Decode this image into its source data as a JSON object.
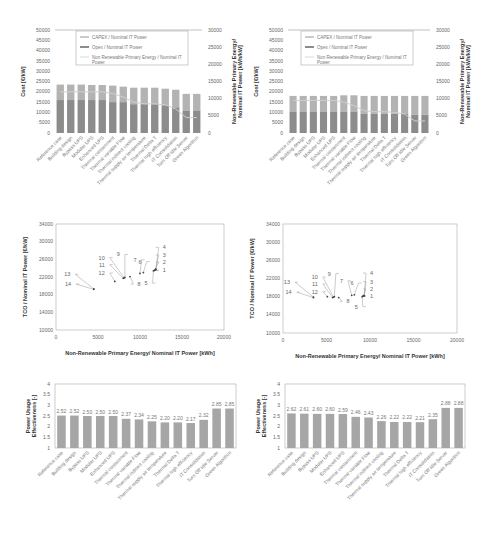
{
  "chart_data": [
    {
      "id": "cost_left",
      "type": "bar",
      "stacked": true,
      "categories": [
        "Reference case",
        "Building design",
        "Bypass UPS",
        "Modular UPS",
        "Enhanced UPS",
        "Thermal containment",
        "Thermal variable Flow",
        "Thermal indirect cooling",
        "Thermal supply air temperature",
        "Thermal Delta T",
        "Thermal high efficiency",
        "IT Consolidation",
        "Turn Off Idle Server",
        "Green Algorithm"
      ],
      "series": [
        {
          "name": "Opex / Nominal IT Power",
          "values": [
            16000,
            16000,
            16000,
            16000,
            16000,
            15000,
            15000,
            14000,
            14000,
            14000,
            13500,
            12500,
            11000,
            11000
          ],
          "color": "#8c8c8c"
        },
        {
          "name": "CAPEX / Nominal IT Power",
          "values": [
            7500,
            7500,
            7500,
            7300,
            7300,
            8000,
            7500,
            8000,
            8000,
            8000,
            8000,
            8500,
            8000,
            8000
          ],
          "color": "#b3b3b3"
        }
      ],
      "line_series": {
        "name": "Non Renewable Primary Energy / Nominal IT Power",
        "axis": "right",
        "values": [
          12000,
          12000,
          12000,
          12000,
          12000,
          11500,
          10500,
          9000,
          8500,
          8500,
          8200,
          7000,
          4500,
          4500
        ],
        "color": "#c8c8c8"
      },
      "ylabel": "Cost [€/kW]",
      "y2label": "Non-Renewable Primary Energy/ Nominal IT Power [kWh/kW]",
      "ylim": [
        0,
        50000
      ],
      "y2lim": [
        0,
        30000
      ],
      "yticks": [
        0,
        5000,
        10000,
        15000,
        20000,
        25000,
        30000,
        35000,
        40000,
        45000,
        50000
      ],
      "y2ticks": [
        0,
        5000,
        10000,
        15000,
        20000,
        25000,
        30000
      ],
      "legend": [
        "CAPEX / Nominal IT Power",
        "Opex / Nominal IT Power",
        "Non Renewable Primary Energy / Nominal IT Power"
      ]
    },
    {
      "id": "cost_right",
      "type": "bar",
      "stacked": true,
      "categories": [
        "Reference case",
        "Building design",
        "Bypass UPS",
        "Modular UPS",
        "Enhanced UPS",
        "Thermal containment",
        "Thermal variable Flow",
        "Thermal indirect cooling",
        "Thermal supply air temperature",
        "Thermal Delta T",
        "Thermal high efficiency",
        "IT Consolidation",
        "Turn Off Idle Server",
        "Green Algorithm"
      ],
      "series": [
        {
          "name": "Opex / Nominal IT Power",
          "values": [
            10500,
            10500,
            10500,
            10500,
            10500,
            10500,
            10500,
            9500,
            9500,
            9500,
            9500,
            9500,
            9000,
            9000
          ],
          "color": "#8c8c8c"
        },
        {
          "name": "CAPEX / Nominal IT Power",
          "values": [
            7500,
            7500,
            7500,
            7500,
            7500,
            7800,
            7800,
            8500,
            8500,
            8500,
            8500,
            8500,
            9000,
            9000
          ],
          "color": "#b3b3b3"
        }
      ],
      "line_series": {
        "name": "Non Renewable Primary Energy / Nominal IT Power",
        "axis": "right",
        "values": [
          9500,
          9500,
          9500,
          9500,
          9500,
          9000,
          8000,
          6500,
          6200,
          6200,
          6000,
          5500,
          3500,
          3500
        ],
        "color": "#c8c8c8"
      },
      "ylabel": "Cost [€/kW]",
      "y2label": "Non-Renewable Primary Energy/ Nominal IT Power [kWh/kW]",
      "ylim": [
        0,
        50000
      ],
      "y2lim": [
        0,
        30000
      ],
      "yticks": [
        0,
        5000,
        10000,
        15000,
        20000,
        25000,
        30000,
        35000,
        40000,
        45000,
        50000
      ],
      "y2ticks": [
        0,
        5000,
        10000,
        15000,
        20000,
        25000,
        30000
      ],
      "legend": [
        "CAPEX / Nominal IT Power",
        "Opex / Nominal IT Power",
        "Non Renewable Primary Energy / Nominal IT Power"
      ]
    },
    {
      "id": "tco_left",
      "type": "scatter",
      "xlabel": "Non-Renewable Primary Energy/ Nominal IT Power [kWh]",
      "ylabel": "TCO / Nominal IT Power [€/kW]",
      "xlim": [
        0,
        20000
      ],
      "ylim": [
        10000,
        34000
      ],
      "xticks": [
        0,
        5000,
        10000,
        15000,
        20000
      ],
      "yticks": [
        10000,
        14000,
        18000,
        22000,
        26000,
        30000,
        34000
      ],
      "points": [
        {
          "label": "1",
          "x": 11700,
          "y": 23500,
          "lx": 12700,
          "ly": 23500
        },
        {
          "label": "2",
          "x": 11800,
          "y": 23600,
          "lx": 12700,
          "ly": 25400
        },
        {
          "label": "3",
          "x": 11850,
          "y": 23700,
          "lx": 12700,
          "ly": 27000
        },
        {
          "label": "4",
          "x": 11900,
          "y": 23800,
          "lx": 12700,
          "ly": 28700
        },
        {
          "label": "5",
          "x": 11600,
          "y": 23400,
          "lx": 10900,
          "ly": 20600
        },
        {
          "label": "6",
          "x": 10400,
          "y": 23000,
          "lx": 10200,
          "ly": 25500
        },
        {
          "label": "7",
          "x": 10000,
          "y": 22800,
          "lx": 9600,
          "ly": 25900
        },
        {
          "label": "8",
          "x": 8800,
          "y": 22100,
          "lx": 9700,
          "ly": 20400
        },
        {
          "label": "9",
          "x": 8200,
          "y": 21900,
          "lx": 7600,
          "ly": 27100
        },
        {
          "label": "10",
          "x": 8100,
          "y": 21800,
          "lx": 5800,
          "ly": 26400
        },
        {
          "label": "11",
          "x": 8000,
          "y": 21700,
          "lx": 5800,
          "ly": 24800
        },
        {
          "label": "12",
          "x": 7000,
          "y": 21000,
          "lx": 5800,
          "ly": 22900
        },
        {
          "label": "13",
          "x": 4500,
          "y": 19300,
          "lx": 1700,
          "ly": 22600
        },
        {
          "label": "14",
          "x": 4500,
          "y": 19200,
          "lx": 1800,
          "ly": 20400
        }
      ]
    },
    {
      "id": "tco_right",
      "type": "scatter",
      "xlabel": "Non-Renewable Primary Energy/ Nominal IT Power [kWh]",
      "ylabel": "TCO / Nominal IT Power [€/kW]",
      "xlim": [
        0,
        20000
      ],
      "ylim": [
        10000,
        34000
      ],
      "xticks": [
        0,
        5000,
        10000,
        15000,
        20000
      ],
      "yticks": [
        10000,
        14000,
        18000,
        22000,
        26000,
        30000,
        34000
      ],
      "points": [
        {
          "label": "1",
          "x": 9200,
          "y": 18100,
          "lx": 10000,
          "ly": 18100
        },
        {
          "label": "2",
          "x": 9250,
          "y": 18150,
          "lx": 10000,
          "ly": 19700
        },
        {
          "label": "3",
          "x": 9300,
          "y": 18200,
          "lx": 10000,
          "ly": 21300
        },
        {
          "label": "4",
          "x": 9350,
          "y": 18250,
          "lx": 10000,
          "ly": 23200
        },
        {
          "label": "5",
          "x": 9100,
          "y": 18000,
          "lx": 8600,
          "ly": 15800
        },
        {
          "label": "6",
          "x": 8200,
          "y": 18400,
          "lx": 8100,
          "ly": 21000
        },
        {
          "label": "7",
          "x": 7900,
          "y": 18300,
          "lx": 6900,
          "ly": 21500
        },
        {
          "label": "8",
          "x": 6400,
          "y": 17800,
          "lx": 7300,
          "ly": 17000
        },
        {
          "label": "9",
          "x": 5900,
          "y": 18000,
          "lx": 5500,
          "ly": 23100
        },
        {
          "label": "10",
          "x": 5800,
          "y": 17900,
          "lx": 4000,
          "ly": 22300
        },
        {
          "label": "11",
          "x": 5700,
          "y": 17800,
          "lx": 4000,
          "ly": 20800
        },
        {
          "label": "12",
          "x": 5100,
          "y": 18000,
          "lx": 4000,
          "ly": 19100
        },
        {
          "label": "13",
          "x": 3500,
          "y": 17900,
          "lx": 800,
          "ly": 21200
        },
        {
          "label": "14",
          "x": 3500,
          "y": 17800,
          "lx": 1000,
          "ly": 19000
        }
      ]
    },
    {
      "id": "pue_left",
      "type": "bar",
      "categories": [
        "Reference case",
        "Building design",
        "Bypass UPS",
        "Modular UPS",
        "Enhanced UPS",
        "Thermal containment",
        "Thermal variable Flow",
        "Thermal indirect cooling",
        "Thermal supply air temperature",
        "Thermal Delta T",
        "Thermal high efficiency",
        "IT Consolidation",
        "Turn Off Idle Server",
        "Green Algorithm"
      ],
      "values": [
        2.52,
        2.52,
        2.5,
        2.5,
        2.5,
        2.37,
        2.34,
        2.25,
        2.2,
        2.2,
        2.17,
        2.32,
        2.85,
        2.85
      ],
      "value_labels": [
        "2.52",
        "2.52",
        "2.50",
        "2.50",
        "2.50",
        "2.37",
        "2.34",
        "2.25",
        "2.20",
        "2.20",
        "2.17",
        "2.32",
        "2.85",
        "2.85"
      ],
      "ylabel": "Power Usage Effectiveness [-]",
      "ylim": [
        1,
        4
      ],
      "yticks": [
        "1",
        "1.5",
        "2",
        "2.5",
        "3",
        "3.5",
        "4"
      ],
      "color": "#a6a6a6"
    },
    {
      "id": "pue_right",
      "type": "bar",
      "categories": [
        "Reference case",
        "Building design",
        "Bypass UPS",
        "Modular UPS",
        "Enhanced UPS",
        "Thermal containment",
        "Thermal variable Flow",
        "Thermal indirect cooling",
        "Thermal supply air temperature",
        "Thermal Delta T",
        "Thermal high efficiency",
        "IT Consolidation",
        "Turn Off Idle Server",
        "Green Algorithm"
      ],
      "values": [
        2.62,
        2.61,
        2.6,
        2.6,
        2.59,
        2.46,
        2.43,
        2.26,
        2.22,
        2.22,
        2.21,
        2.35,
        2.88,
        2.88
      ],
      "value_labels": [
        "2.62",
        "2.61",
        "2.60",
        "2.60",
        "2.59",
        "2.46",
        "2.43",
        "2.26",
        "2.22",
        "2.22",
        "2.21",
        "2.35",
        "2.88",
        "2.88"
      ],
      "ylabel": "Power Usage Effectiveness [-]",
      "ylim": [
        1,
        4
      ],
      "yticks": [
        "1",
        "1.5",
        "2",
        "2.5",
        "3",
        "3.5",
        "4"
      ],
      "color": "#a6a6a6"
    }
  ],
  "layout": {
    "cost": [
      {
        "x0": 55,
        "x1": 202,
        "y0": 30,
        "y1": 133,
        "lx": 80,
        "ly": 31
      },
      {
        "x0": 288,
        "x1": 430,
        "y0": 30,
        "y1": 133,
        "lx": 305,
        "ly": 31
      }
    ],
    "tco": [
      {
        "x0": 56,
        "x1": 224,
        "y0": 224,
        "y1": 330
      },
      {
        "x0": 283,
        "x1": 457,
        "y0": 224,
        "y1": 333
      }
    ],
    "pue": [
      {
        "x0": 55,
        "x1": 236,
        "y0": 384,
        "y1": 448
      },
      {
        "x0": 285,
        "x1": 465,
        "y0": 384,
        "y1": 448
      }
    ]
  }
}
